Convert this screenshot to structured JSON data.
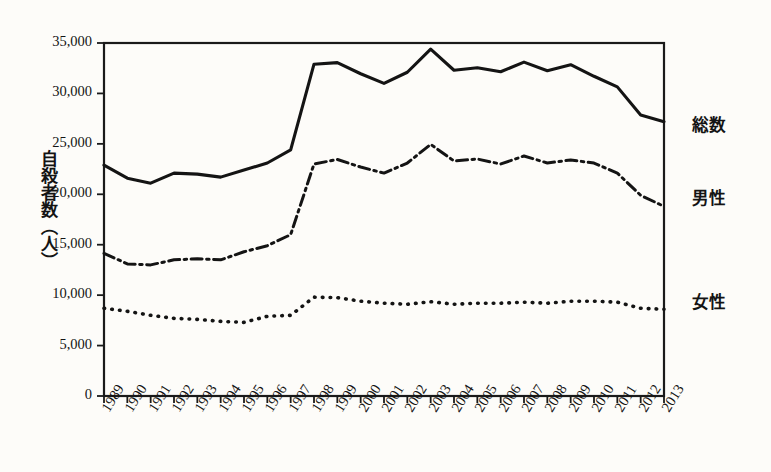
{
  "chart_data": {
    "type": "line",
    "title": "",
    "xlabel": "",
    "ylabel": "自殺者数（人）",
    "ylim": [
      0,
      35000
    ],
    "ytick_values": [
      0,
      5000,
      10000,
      15000,
      20000,
      25000,
      30000,
      35000
    ],
    "ytick_labels": [
      "0",
      "5,000",
      "10,000",
      "15,000",
      "20,000",
      "25,000",
      "30,000",
      "35,000"
    ],
    "grid": false,
    "legend_position": "right-inline",
    "categories": [
      "1989",
      "1990",
      "1991",
      "1992",
      "1993",
      "1994",
      "1995",
      "1996",
      "1997",
      "1998",
      "1999",
      "2000",
      "2001",
      "2002",
      "2003",
      "2004",
      "2005",
      "2006",
      "2007",
      "2008",
      "2009",
      "2010",
      "2011",
      "2012",
      "2013"
    ],
    "series": [
      {
        "name": "総数",
        "style": "solid",
        "values": [
          22900,
          21600,
          21100,
          22100,
          22000,
          21700,
          22400,
          23100,
          24400,
          32900,
          33050,
          31950,
          31000,
          32100,
          34400,
          32300,
          32550,
          32150,
          33100,
          32250,
          32850,
          31700,
          30650,
          27850,
          27200
        ]
      },
      {
        "name": "男性",
        "style": "dash-dot",
        "values": [
          14150,
          13100,
          13000,
          13500,
          13600,
          13500,
          14300,
          14900,
          16000,
          23000,
          23450,
          22700,
          22100,
          23100,
          24950,
          23300,
          23500,
          23000,
          23800,
          23100,
          23400,
          23100,
          22100,
          19900,
          18800
        ]
      },
      {
        "name": "女性",
        "style": "dotted",
        "values": [
          8700,
          8400,
          8000,
          7700,
          7600,
          7400,
          7300,
          7900,
          8000,
          9800,
          9750,
          9400,
          9200,
          9100,
          9350,
          9100,
          9200,
          9200,
          9300,
          9200,
          9400,
          9400,
          9300,
          8700,
          8600
        ]
      }
    ],
    "series_labels": [
      {
        "text": "総数",
        "x": 692,
        "y": 112
      },
      {
        "text": "男性",
        "x": 692,
        "y": 185
      },
      {
        "text": "女性",
        "x": 692,
        "y": 289
      }
    ]
  }
}
